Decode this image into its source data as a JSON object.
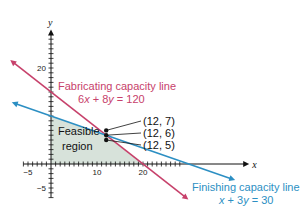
{
  "chart_data": {
    "type": "line",
    "title": "",
    "xlabel": "x",
    "ylabel": "y",
    "xlim": [
      -6,
      42
    ],
    "ylim": [
      -7,
      27
    ],
    "x_tick_labels": [
      {
        "value": -5,
        "label": "−5"
      },
      {
        "value": 10,
        "label": "10"
      },
      {
        "value": 20,
        "label": "20"
      }
    ],
    "y_tick_labels": [
      {
        "value": 20,
        "label": "20"
      },
      {
        "value": -5,
        "label": "−5"
      }
    ],
    "minor_tick_step": 1,
    "series": [
      {
        "name": "Fabricating capacity line",
        "equation": "6x + 8y = 120",
        "color": "#c7416b",
        "x_range": [
          -8,
          29
        ]
      },
      {
        "name": "Finishing capacity line",
        "equation": "x + 3y = 30",
        "color": "#2c8fc3",
        "x_range": [
          -7.5,
          39
        ]
      }
    ],
    "feasible_region": {
      "label_line1": "Feasible",
      "label_line2": "region",
      "vertices": [
        [
          0,
          0
        ],
        [
          20,
          0
        ],
        [
          12,
          6
        ],
        [
          0,
          10
        ]
      ],
      "color": "#d7e2da"
    },
    "points": [
      {
        "x": 12,
        "y": 7,
        "label": "(12, 7)"
      },
      {
        "x": 12,
        "y": 6,
        "label": "(12, 6)"
      },
      {
        "x": 12,
        "y": 5,
        "label": "(12, 5)"
      }
    ],
    "annotations": [
      {
        "text": "Fabricating capacity line",
        "color": "#c7416b"
      },
      {
        "text": "6x + 8y = 120",
        "color": "#c7416b"
      },
      {
        "text": "Finishing capacity line",
        "color": "#2c8fc3"
      },
      {
        "text": "x + 3y = 30",
        "color": "#2c8fc3"
      }
    ],
    "grid": false
  }
}
